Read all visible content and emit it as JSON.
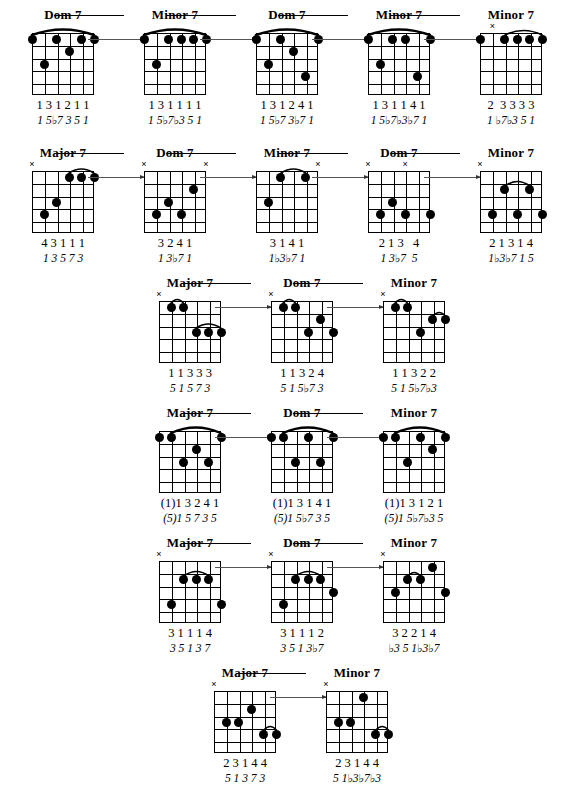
{
  "document": {
    "title": "Seventh Chord Voicings - Guitar Fretboard Diagrams",
    "type": "guitar-chord-chart",
    "strings": 6,
    "frets": 5,
    "symbols": {
      "muted": "×",
      "flat": "♭"
    }
  },
  "rows": [
    {
      "id": "row-1",
      "top": 8,
      "left": 8,
      "spacing": 112,
      "chords": [
        {
          "title": "Dom 7",
          "fingers": "1 3 1 2 1 1",
          "degrees": "1 5♭7 3 5 1",
          "mutes": [],
          "barre": {
            "from": 0,
            "to": 5,
            "fret": 1,
            "arc": 9
          },
          "dots": [
            {
              "string": 0,
              "fret": 1
            },
            {
              "string": 2,
              "fret": 1
            },
            {
              "string": 4,
              "fret": 1
            },
            {
              "string": 5,
              "fret": 1
            },
            {
              "string": 3,
              "fret": 2
            },
            {
              "string": 1,
              "fret": 3
            }
          ]
        },
        {
          "title": "Minor 7",
          "fingers": "1 3 1 1 1 1",
          "degrees": "1 5♭7♭3 5 1",
          "mutes": [],
          "barre": {
            "from": 0,
            "to": 5,
            "fret": 1,
            "arc": 9
          },
          "dots": [
            {
              "string": 0,
              "fret": 1
            },
            {
              "string": 2,
              "fret": 1
            },
            {
              "string": 3,
              "fret": 1
            },
            {
              "string": 4,
              "fret": 1
            },
            {
              "string": 5,
              "fret": 1
            },
            {
              "string": 1,
              "fret": 3
            }
          ]
        },
        {
          "title": "Dom 7",
          "fingers": "1 3 1 2 4 1",
          "degrees": "1 5♭7 3♭7 1",
          "mutes": [],
          "barre": {
            "from": 0,
            "to": 5,
            "fret": 1,
            "arc": 9
          },
          "dots": [
            {
              "string": 0,
              "fret": 1
            },
            {
              "string": 2,
              "fret": 1
            },
            {
              "string": 5,
              "fret": 1
            },
            {
              "string": 3,
              "fret": 2
            },
            {
              "string": 1,
              "fret": 3
            },
            {
              "string": 4,
              "fret": 4
            }
          ]
        },
        {
          "title": "Minor 7",
          "fingers": "1 3 1 1 4 1",
          "degrees": "1 5♭7♭3♭7 1",
          "mutes": [],
          "barre": {
            "from": 0,
            "to": 5,
            "fret": 1,
            "arc": 9
          },
          "dots": [
            {
              "string": 0,
              "fret": 1
            },
            {
              "string": 2,
              "fret": 1
            },
            {
              "string": 3,
              "fret": 1
            },
            {
              "string": 5,
              "fret": 1
            },
            {
              "string": 1,
              "fret": 3
            },
            {
              "string": 4,
              "fret": 4
            }
          ]
        },
        {
          "title": "Minor 7",
          "fingers": "2  3 3 3 3",
          "degrees": "1 ♭7♭3 5 1",
          "mutes": [
            1
          ],
          "barre": {
            "from": 2,
            "to": 5,
            "fret": 1,
            "arc": 7
          },
          "dots": [
            {
              "string": 0,
              "fret": 1
            },
            {
              "string": 2,
              "fret": 1
            },
            {
              "string": 3,
              "fret": 1
            },
            {
              "string": 4,
              "fret": 1
            },
            {
              "string": 5,
              "fret": 1
            }
          ]
        }
      ]
    },
    {
      "id": "row-2",
      "top": 146,
      "left": 8,
      "spacing": 112,
      "chords": [
        {
          "title": "Major 7",
          "fingers": "4 3 1 1 1",
          "degrees": "1 3 5 7 3",
          "mutes": [
            0
          ],
          "barre": {
            "from": 3,
            "to": 5,
            "fret": 1,
            "arc": 6
          },
          "dots": [
            {
              "string": 3,
              "fret": 1
            },
            {
              "string": 4,
              "fret": 1
            },
            {
              "string": 5,
              "fret": 1
            },
            {
              "string": 2,
              "fret": 3
            },
            {
              "string": 1,
              "fret": 4
            }
          ]
        },
        {
          "title": "Dom 7",
          "fingers": "3 2 4 1",
          "degrees": "1 3♭7 1",
          "mutes": [
            0,
            5
          ],
          "barre": null,
          "dots": [
            {
              "string": 4,
              "fret": 2
            },
            {
              "string": 2,
              "fret": 3
            },
            {
              "string": 3,
              "fret": 4
            },
            {
              "string": 1,
              "fret": 4
            }
          ]
        },
        {
          "title": "Minor 7",
          "fingers": "3 1 4 1",
          "degrees": "1♭3♭7 1",
          "mutes": [
            5
          ],
          "barre": {
            "from": 2,
            "to": 4,
            "fret": 1,
            "arc": 6
          },
          "dots": [
            {
              "string": 2,
              "fret": 1
            },
            {
              "string": 4,
              "fret": 1
            },
            {
              "string": 1,
              "fret": 3
            }
          ]
        },
        {
          "title": "Dom 7",
          "fingers": "2 1 3   4",
          "degrees": "1 3♭7  5",
          "mutes": [
            0,
            3
          ],
          "barre": null,
          "dots": [
            {
              "string": 1,
              "fret": 4
            },
            {
              "string": 2,
              "fret": 3
            },
            {
              "string": 3,
              "fret": 4
            },
            {
              "string": 5,
              "fret": 4
            }
          ]
        },
        {
          "title": "Minor 7",
          "fingers": "2 1 3 1 4",
          "degrees": "1♭3♭7 1 5",
          "mutes": [
            0
          ],
          "barre": {
            "from": 2,
            "to": 4,
            "fret": 2,
            "arc": 7
          },
          "dots": [
            {
              "string": 2,
              "fret": 2
            },
            {
              "string": 4,
              "fret": 2
            },
            {
              "string": 1,
              "fret": 4
            },
            {
              "string": 3,
              "fret": 4
            },
            {
              "string": 5,
              "fret": 4
            }
          ]
        }
      ]
    },
    {
      "id": "row-3",
      "top": 276,
      "left": 135,
      "spacing": 112,
      "chords": [
        {
          "title": "Major 7",
          "fingers": "1 1 3 3 3",
          "degrees": "5 1 5 7 3",
          "mutes": [
            0
          ],
          "barre": {
            "from": 1,
            "to": 2,
            "fret": 1,
            "arc": 5
          },
          "barre2": {
            "from": 3,
            "to": 5,
            "fret": 3,
            "arc": 6
          },
          "dots": [
            {
              "string": 1,
              "fret": 1
            },
            {
              "string": 2,
              "fret": 1
            },
            {
              "string": 3,
              "fret": 3
            },
            {
              "string": 4,
              "fret": 3
            },
            {
              "string": 5,
              "fret": 3
            }
          ]
        },
        {
          "title": "Dom 7",
          "fingers": "1 1 3 2 4",
          "degrees": "5 1 5♭7 3",
          "mutes": [
            0
          ],
          "barre": {
            "from": 1,
            "to": 2,
            "fret": 1,
            "arc": 5
          },
          "dots": [
            {
              "string": 1,
              "fret": 1
            },
            {
              "string": 2,
              "fret": 1
            },
            {
              "string": 4,
              "fret": 2
            },
            {
              "string": 3,
              "fret": 3
            },
            {
              "string": 5,
              "fret": 3
            }
          ]
        },
        {
          "title": "Minor 7",
          "fingers": "1 1 3 2 2",
          "degrees": "5 1 5♭7♭3",
          "mutes": [
            0
          ],
          "barre": {
            "from": 1,
            "to": 2,
            "fret": 1,
            "arc": 5
          },
          "barre2": {
            "from": 4,
            "to": 5,
            "fret": 2,
            "arc": 5
          },
          "dots": [
            {
              "string": 1,
              "fret": 1
            },
            {
              "string": 2,
              "fret": 1
            },
            {
              "string": 4,
              "fret": 2
            },
            {
              "string": 5,
              "fret": 2
            },
            {
              "string": 3,
              "fret": 3
            }
          ]
        }
      ]
    },
    {
      "id": "row-4",
      "top": 406,
      "left": 135,
      "spacing": 112,
      "chords": [
        {
          "title": "Major 7",
          "fingers": "(1)1 3 2 4 1",
          "degrees": "(5)1 5 7 3 5",
          "mutes": [],
          "barre": {
            "from": 1,
            "to": 5,
            "fret": 1,
            "arc": 9
          },
          "dots": [
            {
              "string": 0,
              "fret": 1
            },
            {
              "string": 1,
              "fret": 1
            },
            {
              "string": 5,
              "fret": 1
            },
            {
              "string": 3,
              "fret": 2
            },
            {
              "string": 2,
              "fret": 3
            },
            {
              "string": 4,
              "fret": 3
            }
          ]
        },
        {
          "title": "Dom 7",
          "fingers": "(1)1 3 1 4 1",
          "degrees": "(5)1 5♭7 3 5",
          "mutes": [],
          "barre": {
            "from": 1,
            "to": 5,
            "fret": 1,
            "arc": 9
          },
          "dots": [
            {
              "string": 0,
              "fret": 1
            },
            {
              "string": 1,
              "fret": 1
            },
            {
              "string": 3,
              "fret": 1
            },
            {
              "string": 5,
              "fret": 1
            },
            {
              "string": 2,
              "fret": 3
            },
            {
              "string": 4,
              "fret": 3
            }
          ]
        },
        {
          "title": "Minor 7",
          "fingers": "(1)1 3 1 2 1",
          "degrees": "(5)1 5♭7♭3 5",
          "mutes": [],
          "barre": {
            "from": 1,
            "to": 5,
            "fret": 1,
            "arc": 9
          },
          "dots": [
            {
              "string": 0,
              "fret": 1
            },
            {
              "string": 1,
              "fret": 1
            },
            {
              "string": 3,
              "fret": 1
            },
            {
              "string": 5,
              "fret": 1
            },
            {
              "string": 4,
              "fret": 2
            },
            {
              "string": 2,
              "fret": 3
            }
          ]
        }
      ]
    },
    {
      "id": "row-5",
      "top": 536,
      "left": 135,
      "spacing": 112,
      "chords": [
        {
          "title": "Major 7",
          "fingers": "3 1 1 1 4",
          "degrees": "3 5 1 3 7",
          "mutes": [
            0
          ],
          "barre": {
            "from": 2,
            "to": 4,
            "fret": 2,
            "arc": 7
          },
          "dots": [
            {
              "string": 2,
              "fret": 2
            },
            {
              "string": 3,
              "fret": 2
            },
            {
              "string": 4,
              "fret": 2
            },
            {
              "string": 1,
              "fret": 4
            },
            {
              "string": 5,
              "fret": 4
            }
          ]
        },
        {
          "title": "Dom 7",
          "fingers": "3 1 1 1 2",
          "degrees": "3 5 1 3♭7",
          "mutes": [
            0
          ],
          "barre": {
            "from": 2,
            "to": 4,
            "fret": 2,
            "arc": 7
          },
          "dots": [
            {
              "string": 2,
              "fret": 2
            },
            {
              "string": 3,
              "fret": 2
            },
            {
              "string": 4,
              "fret": 2
            },
            {
              "string": 5,
              "fret": 3
            },
            {
              "string": 1,
              "fret": 4
            }
          ]
        },
        {
          "title": "Minor 7",
          "fingers": "3 2 2 1 4",
          "degrees": "♭3 5 1♭3♭7",
          "mutes": [
            0
          ],
          "barre": {
            "from": 2,
            "to": 3,
            "fret": 2,
            "arc": 5
          },
          "dots": [
            {
              "string": 4,
              "fret": 1
            },
            {
              "string": 2,
              "fret": 2
            },
            {
              "string": 3,
              "fret": 2
            },
            {
              "string": 1,
              "fret": 3
            },
            {
              "string": 5,
              "fret": 3
            }
          ]
        }
      ]
    },
    {
      "id": "row-6",
      "top": 666,
      "left": 190,
      "spacing": 112,
      "chords": [
        {
          "title": "Major 7",
          "fingers": "2 3 1 4 4",
          "degrees": "5 1 3 7 3",
          "mutes": [
            0
          ],
          "barre": {
            "from": 4,
            "to": 5,
            "fret": 4,
            "arc": 5
          },
          "dots": [
            {
              "string": 3,
              "fret": 2
            },
            {
              "string": 1,
              "fret": 3
            },
            {
              "string": 2,
              "fret": 3
            },
            {
              "string": 4,
              "fret": 4
            },
            {
              "string": 5,
              "fret": 4
            }
          ]
        },
        {
          "title": "Minor 7",
          "fingers": "2 3 1 4 4",
          "degrees": "5 1♭3♭7♭3",
          "mutes": [
            0
          ],
          "barre": {
            "from": 4,
            "to": 5,
            "fret": 4,
            "arc": 5
          },
          "dots": [
            {
              "string": 3,
              "fret": 1
            },
            {
              "string": 1,
              "fret": 3
            },
            {
              "string": 2,
              "fret": 3
            },
            {
              "string": 4,
              "fret": 4
            },
            {
              "string": 5,
              "fret": 4
            }
          ]
        }
      ]
    }
  ]
}
